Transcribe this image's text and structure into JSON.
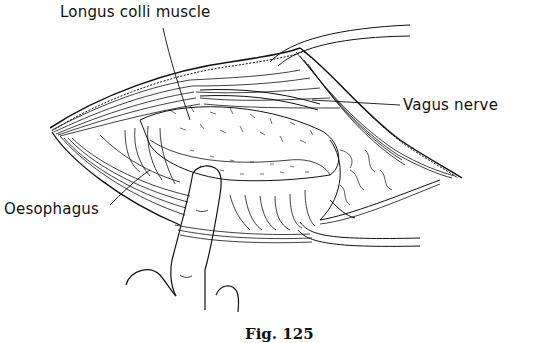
{
  "figure": {
    "caption": "Fig. 125",
    "labels": {
      "longus_colli": "Longus colli muscle",
      "vagus": "Vagus nerve",
      "oesophagus": "Oesophagus"
    }
  }
}
